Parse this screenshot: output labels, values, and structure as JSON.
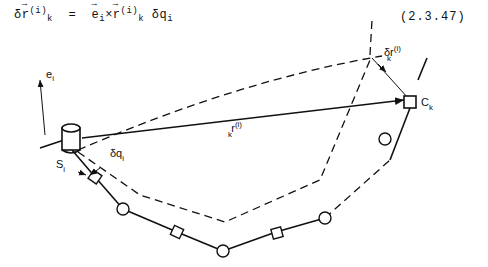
{
  "equation": {
    "lhs_delta": "δ",
    "lhs_symbol": "r",
    "lhs_sup": "(i)",
    "lhs_sub": "k",
    "equals": "=",
    "e_symbol": "e",
    "e_sub": "i",
    "times": "×",
    "r_symbol": "r",
    "r_sup": "(i)",
    "r_sub": "k",
    "dq": "δq",
    "dq_sub": "i",
    "number": "(2.3.47)"
  },
  "figure": {
    "labels": {
      "e_i": "e",
      "e_i_sub": "i",
      "r_k": "r",
      "r_k_sup": "(i)",
      "r_k_sub": "k",
      "delta_r_k": "δr",
      "delta_r_k_sup": "(i)",
      "delta_r_k_sub": "k",
      "C_k": "C",
      "C_k_sub": "k",
      "S_i": "S",
      "S_i_sub": "i",
      "delta_q_i": "δq",
      "delta_q_i_sub": "i"
    }
  }
}
